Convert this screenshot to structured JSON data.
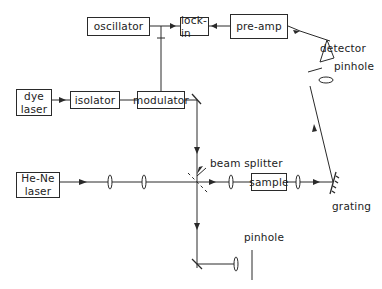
{
  "diagram": {
    "type": "optical-setup",
    "boxes": {
      "oscillator": "oscillator",
      "lock_in": "lock-in",
      "pre_amp": "pre-amp",
      "dye_laser_line1": "dye",
      "dye_laser_line2": "laser",
      "isolator": "isolator",
      "modulator": "modulator",
      "hene_laser_line1": "He-Ne",
      "hene_laser_line2": "laser",
      "sample": "sample"
    },
    "labels": {
      "detector": "detector",
      "pinhole_top": "pinhole",
      "beam_splitter": "beam splitter",
      "grating": "grating",
      "pinhole_bottom": "pinhole"
    },
    "colors": {
      "line": "#2a2a2a",
      "background": "#ffffff"
    }
  }
}
